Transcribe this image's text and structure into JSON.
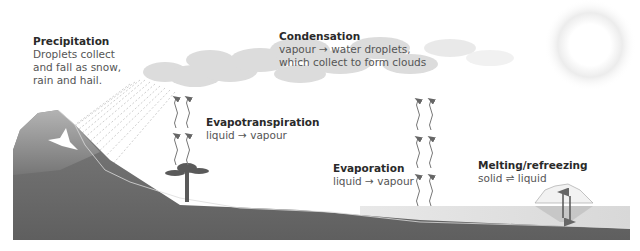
{
  "diagram": {
    "colors": {
      "ground": "#6e6e6e",
      "ground_light": "#a9a9a9",
      "cloud": "#d4d4d4",
      "water": "#dcdcdc",
      "arrow": "#666666",
      "text_title": "#2a2a2a",
      "text_body": "#555555"
    },
    "labels": {
      "precipitation": {
        "title": "Precipitation",
        "body": "Droplets collect\nand fall as snow,\nrain and hail."
      },
      "condensation": {
        "title": "Condensation",
        "body": "vapour → water droplets,\nwhich collect to form clouds"
      },
      "evapotranspiration": {
        "title": "Evapotranspiration",
        "body": "liquid → vapour"
      },
      "evaporation": {
        "title": "Evaporation",
        "body": "liquid → vapour"
      },
      "melting": {
        "title": "Melting/refreezing",
        "body": "solid ⇌ liquid"
      }
    },
    "icons": [
      "sun-icon",
      "cloud-icon",
      "mountain-icon",
      "tree-icon",
      "iceberg-icon",
      "vapour-arrow-icon",
      "rain-icon"
    ]
  }
}
